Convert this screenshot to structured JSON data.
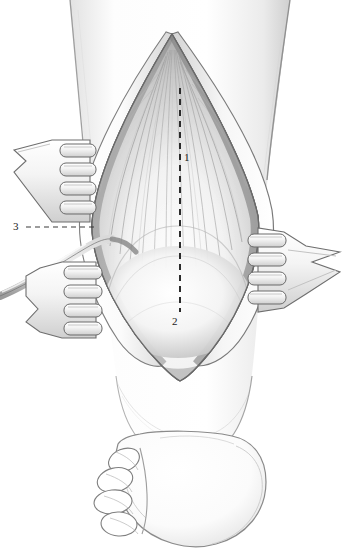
{
  "figure": {
    "domain": "medical-illustration",
    "view": "posterior view of lower leg, knee above, heel and toes below",
    "background_color": "#ffffff",
    "ink_color": "#1a1a1a",
    "shade_color": "#8c8c8c",
    "width_px": 342,
    "height_px": 558
  },
  "labels": [
    {
      "id": "1",
      "text": "1",
      "x": 188,
      "y": 158,
      "target": "gastrocnemius muscle belly / aponeurosis fibers",
      "leader": "none"
    },
    {
      "id": "2",
      "text": "2",
      "x": 176,
      "y": 322,
      "target": "distal tendinous junction at lower wound",
      "leader": "dashed-vertical-midline"
    },
    {
      "id": "3",
      "text": "3",
      "x": 17,
      "y": 228,
      "target": "sural nerve / small saphenous vein cord",
      "leader": "dashed-horizontal"
    }
  ],
  "leaders": [
    {
      "name": "midline-dashed-line",
      "type": "dashed",
      "x1": 180,
      "y1": 88,
      "x2": 180,
      "y2": 312,
      "dash": "6 5",
      "width": 2.0,
      "color": "#2b2b2b"
    },
    {
      "name": "label-3-dashed-leader",
      "type": "dashed",
      "x1": 26,
      "y1": 227,
      "x2": 96,
      "y2": 227,
      "dash": "5 4",
      "width": 1.1,
      "color": "#3a3a3a"
    }
  ],
  "wound": {
    "name": "elliptical-surgical-wound",
    "apex_top": {
      "x": 172,
      "y": 34
    },
    "apex_bottom": {
      "x": 180,
      "y": 381
    },
    "left_max": {
      "x": 92,
      "y": 230
    },
    "right_max": {
      "x": 258,
      "y": 215
    },
    "contents": "exposed muscle fibers converging to a central raphe, rounded tendinous bulge inferiorly"
  },
  "retractors": [
    {
      "name": "retractor-upper-left",
      "prongs": 4,
      "prong_direction": "right",
      "blade_x": 60,
      "blade_y": 140,
      "handle_to": {
        "x": 14,
        "y": 160
      }
    },
    {
      "name": "retractor-lower-left",
      "prongs": 4,
      "prong_direction": "right",
      "blade_x": 62,
      "blade_y": 268,
      "handle_to": {
        "x": 26,
        "y": 300
      }
    },
    {
      "name": "retractor-right",
      "prongs": 4,
      "prong_direction": "left",
      "blade_x": 256,
      "blade_y": 232,
      "handle_to": {
        "x": 340,
        "y": 262
      }
    }
  ],
  "anatomy": {
    "leg_left_edge_x": 70,
    "leg_right_edge_top_x": 290,
    "leg_right_edge_bottom_x": 268,
    "heel": {
      "cx": 188,
      "cy": 492,
      "rx": 78,
      "ry": 56
    },
    "toes_count": 4,
    "toes_side": "left"
  }
}
